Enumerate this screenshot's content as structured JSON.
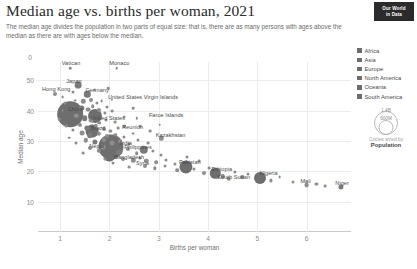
{
  "header": {
    "title": "Median age vs. births per woman, 2021",
    "subtitle": "The median age divides the population in two parts of equal size: that is, there are as many persons with ages above the median as there are with ages below the median."
  },
  "badge": {
    "line1": "Our World",
    "line2": "in Data"
  },
  "legend": {
    "entries": [
      {
        "label": "Africa",
        "color": "#6d6d6d"
      },
      {
        "label": "Asia",
        "color": "#6d6d6d"
      },
      {
        "label": "Europe",
        "color": "#6d6d6d"
      },
      {
        "label": "North America",
        "color": "#6d6d6d"
      },
      {
        "label": "Oceania",
        "color": "#6d6d6d"
      },
      {
        "label": "South America",
        "color": "#6d6d6d"
      }
    ],
    "size_top": "1.4B",
    "size_mid": "600M",
    "size_caption_1": "Circles sized by",
    "size_caption_2": "Population"
  },
  "chart_data": {
    "type": "scatter",
    "title": "Median age vs. births per woman, 2021",
    "xlabel": "Births per woman",
    "ylabel": "Median age",
    "xlim": [
      0.55,
      6.9
    ],
    "ylim": [
      0,
      56
    ],
    "xticks": [
      "0",
      "1",
      "2",
      "3",
      "4",
      "5",
      "6"
    ],
    "xtick_values": [
      0,
      1,
      2,
      3,
      4,
      5,
      6
    ],
    "yticks": [
      "10",
      "20",
      "30",
      "40",
      "50"
    ],
    "ytick_values": [
      10,
      20,
      30,
      40,
      50
    ],
    "grid": true,
    "legend_position": "right",
    "size_encoding": "Population",
    "points": [
      {
        "name": "Vatican",
        "x": 1.2,
        "y": 54.0,
        "r": 1.3,
        "label": true,
        "lx": 1.22,
        "ly": 55.6
      },
      {
        "name": "Monaco",
        "x": 2.15,
        "y": 53.9,
        "r": 1.3,
        "label": true,
        "lx": 2.2,
        "ly": 55.6
      },
      {
        "name": "Japan",
        "x": 1.36,
        "y": 48.4,
        "r": 3.4,
        "label": true,
        "lx": 1.28,
        "ly": 49.9
      },
      {
        "name": "Hong Kong",
        "x": 0.9,
        "y": 45.6,
        "r": 2.0,
        "label": true,
        "lx": 0.92,
        "ly": 47.1
      },
      {
        "name": "Germany",
        "x": 1.55,
        "y": 45.4,
        "r": 3.2,
        "label": true,
        "lx": 1.75,
        "ly": 46.7
      },
      {
        "name": "China",
        "x": 1.2,
        "y": 38.9,
        "r": 12.8,
        "label": true,
        "lx": 1.31,
        "ly": 40.6
      },
      {
        "name": "United States",
        "x": 1.7,
        "y": 38.2,
        "r": 7.0,
        "label": true,
        "lx": 1.97,
        "ly": 37.6
      },
      {
        "name": "United States Virgin Islands",
        "x": 2.05,
        "y": 43.5,
        "r": 1.2,
        "label": true,
        "lx": 2.68,
        "ly": 44.6
      },
      {
        "name": "Faroe Islands",
        "x": 2.55,
        "y": 37.5,
        "r": 1.2,
        "label": true,
        "lx": 3.15,
        "ly": 38.5
      },
      {
        "name": "Brazil",
        "x": 1.65,
        "y": 33.2,
        "r": 6.4,
        "label": true,
        "lx": 1.77,
        "ly": 34.4
      },
      {
        "name": "Reunion",
        "x": 2.3,
        "y": 34.8,
        "r": 1.2,
        "label": true,
        "lx": 2.47,
        "ly": 34.6
      },
      {
        "name": "Kazakhstan",
        "x": 3.05,
        "y": 30.9,
        "r": 2.2,
        "label": true,
        "lx": 3.24,
        "ly": 32.1
      },
      {
        "name": "India",
        "x": 2.03,
        "y": 27.9,
        "r": 12.6,
        "label": true,
        "lx": 2.33,
        "ly": 29.3
      },
      {
        "name": "Nepal",
        "x": 1.87,
        "y": 27.9,
        "r": 2.4,
        "label": true,
        "lx": 1.74,
        "ly": 28.4
      },
      {
        "name": "Philippines",
        "x": 2.7,
        "y": 27.0,
        "r": 4.2,
        "label": true,
        "lx": 2.58,
        "ly": 28.1
      },
      {
        "name": "Bangladesh",
        "x": 2.0,
        "y": 25.1,
        "r": 5.6,
        "label": true,
        "lx": 2.4,
        "ly": 24.6
      },
      {
        "name": "Syria",
        "x": 2.75,
        "y": 23.5,
        "r": 2.2,
        "label": true,
        "lx": 2.67,
        "ly": 22.8
      },
      {
        "name": "Pakistan",
        "x": 3.55,
        "y": 21.5,
        "r": 6.6,
        "label": true,
        "lx": 3.63,
        "ly": 23.2
      },
      {
        "name": "Ethiopia",
        "x": 4.15,
        "y": 19.3,
        "r": 5.2,
        "label": true,
        "lx": 4.28,
        "ly": 20.6
      },
      {
        "name": "South Sudan",
        "x": 4.42,
        "y": 17.6,
        "r": 2.2,
        "label": true,
        "lx": 4.52,
        "ly": 18.1
      },
      {
        "name": "Nigeria",
        "x": 5.05,
        "y": 17.7,
        "r": 6.0,
        "label": true,
        "lx": 5.23,
        "ly": 19.4
      },
      {
        "name": "Mali",
        "x": 6.0,
        "y": 15.5,
        "r": 2.4,
        "label": true,
        "lx": 5.98,
        "ly": 16.7
      },
      {
        "name": "Niger",
        "x": 6.7,
        "y": 14.8,
        "r": 2.6,
        "label": true,
        "lx": 6.72,
        "ly": 16.3
      },
      {
        "name": "c01",
        "x": 1.09,
        "y": 42.6,
        "r": 1.6,
        "label": false
      },
      {
        "name": "c02",
        "x": 1.3,
        "y": 43.3,
        "r": 1.4,
        "label": false
      },
      {
        "name": "c03",
        "x": 1.47,
        "y": 43.0,
        "r": 2.2,
        "label": false
      },
      {
        "name": "c04",
        "x": 1.62,
        "y": 43.6,
        "r": 2.0,
        "label": false
      },
      {
        "name": "c05",
        "x": 1.74,
        "y": 42.4,
        "r": 1.6,
        "label": false
      },
      {
        "name": "c06",
        "x": 1.84,
        "y": 43.1,
        "r": 1.4,
        "label": false
      },
      {
        "name": "c07",
        "x": 1.95,
        "y": 41.2,
        "r": 1.5,
        "label": false
      },
      {
        "name": "c08",
        "x": 1.43,
        "y": 41.0,
        "r": 2.6,
        "label": false
      },
      {
        "name": "c09",
        "x": 1.57,
        "y": 40.3,
        "r": 2.4,
        "label": false
      },
      {
        "name": "c10",
        "x": 1.66,
        "y": 41.5,
        "r": 1.8,
        "label": false
      },
      {
        "name": "c11",
        "x": 1.78,
        "y": 40.1,
        "r": 2.0,
        "label": false
      },
      {
        "name": "c12",
        "x": 1.9,
        "y": 39.3,
        "r": 1.6,
        "label": false
      },
      {
        "name": "c13",
        "x": 2.05,
        "y": 39.8,
        "r": 1.4,
        "label": false
      },
      {
        "name": "c14",
        "x": 1.33,
        "y": 38.3,
        "r": 2.2,
        "label": false
      },
      {
        "name": "c15",
        "x": 1.5,
        "y": 37.4,
        "r": 2.8,
        "label": false
      },
      {
        "name": "c16",
        "x": 1.63,
        "y": 36.7,
        "r": 2.4,
        "label": false
      },
      {
        "name": "c17",
        "x": 1.79,
        "y": 36.0,
        "r": 1.8,
        "label": false
      },
      {
        "name": "c18",
        "x": 1.92,
        "y": 36.8,
        "r": 1.5,
        "label": false
      },
      {
        "name": "c19",
        "x": 2.12,
        "y": 36.2,
        "r": 1.4,
        "label": false
      },
      {
        "name": "c20",
        "x": 2.3,
        "y": 38.0,
        "r": 1.3,
        "label": false
      },
      {
        "name": "c21",
        "x": 1.4,
        "y": 35.1,
        "r": 2.0,
        "label": false
      },
      {
        "name": "c22",
        "x": 1.55,
        "y": 34.3,
        "r": 2.6,
        "label": false
      },
      {
        "name": "c23",
        "x": 1.72,
        "y": 35.0,
        "r": 2.2,
        "label": false
      },
      {
        "name": "c24",
        "x": 1.88,
        "y": 34.0,
        "r": 2.0,
        "label": false
      },
      {
        "name": "c25",
        "x": 2.02,
        "y": 33.4,
        "r": 1.6,
        "label": false
      },
      {
        "name": "c26",
        "x": 2.18,
        "y": 34.2,
        "r": 1.4,
        "label": false
      },
      {
        "name": "c27",
        "x": 1.25,
        "y": 33.6,
        "r": 1.6,
        "label": false
      },
      {
        "name": "c28",
        "x": 1.44,
        "y": 32.6,
        "r": 2.4,
        "label": false
      },
      {
        "name": "c29",
        "x": 1.6,
        "y": 31.8,
        "r": 2.8,
        "label": false
      },
      {
        "name": "c30",
        "x": 1.78,
        "y": 32.4,
        "r": 2.2,
        "label": false
      },
      {
        "name": "c31",
        "x": 1.95,
        "y": 31.5,
        "r": 2.0,
        "label": false
      },
      {
        "name": "c32",
        "x": 2.12,
        "y": 32.0,
        "r": 1.7,
        "label": false
      },
      {
        "name": "c33",
        "x": 2.3,
        "y": 31.2,
        "r": 1.5,
        "label": false
      },
      {
        "name": "c34",
        "x": 2.48,
        "y": 32.4,
        "r": 1.4,
        "label": false
      },
      {
        "name": "c35",
        "x": 1.52,
        "y": 30.2,
        "r": 2.2,
        "label": false
      },
      {
        "name": "c36",
        "x": 1.7,
        "y": 29.6,
        "r": 2.6,
        "label": false
      },
      {
        "name": "c37",
        "x": 1.88,
        "y": 30.4,
        "r": 2.0,
        "label": false
      },
      {
        "name": "c38",
        "x": 2.05,
        "y": 29.2,
        "r": 2.4,
        "label": false
      },
      {
        "name": "c39",
        "x": 2.22,
        "y": 30.0,
        "r": 1.8,
        "label": false
      },
      {
        "name": "c40",
        "x": 2.4,
        "y": 29.0,
        "r": 1.6,
        "label": false
      },
      {
        "name": "c41",
        "x": 2.58,
        "y": 30.2,
        "r": 1.5,
        "label": false
      },
      {
        "name": "c42",
        "x": 2.78,
        "y": 29.4,
        "r": 1.4,
        "label": false
      },
      {
        "name": "c43",
        "x": 1.6,
        "y": 27.6,
        "r": 2.0,
        "label": false
      },
      {
        "name": "c44",
        "x": 1.78,
        "y": 26.8,
        "r": 2.2,
        "label": false
      },
      {
        "name": "c45",
        "x": 2.2,
        "y": 26.4,
        "r": 2.6,
        "label": false
      },
      {
        "name": "c46",
        "x": 2.38,
        "y": 27.2,
        "r": 2.0,
        "label": false
      },
      {
        "name": "c47",
        "x": 2.55,
        "y": 26.0,
        "r": 1.8,
        "label": false
      },
      {
        "name": "c48",
        "x": 2.88,
        "y": 26.6,
        "r": 1.6,
        "label": false
      },
      {
        "name": "c49",
        "x": 3.05,
        "y": 25.4,
        "r": 1.5,
        "label": false
      },
      {
        "name": "c50",
        "x": 2.28,
        "y": 24.2,
        "r": 2.0,
        "label": false
      },
      {
        "name": "c51",
        "x": 2.48,
        "y": 23.6,
        "r": 2.2,
        "label": false
      },
      {
        "name": "c52",
        "x": 2.62,
        "y": 24.4,
        "r": 1.6,
        "label": false
      },
      {
        "name": "c53",
        "x": 2.95,
        "y": 23.0,
        "r": 1.8,
        "label": false
      },
      {
        "name": "c54",
        "x": 3.15,
        "y": 23.8,
        "r": 1.5,
        "label": false
      },
      {
        "name": "c55",
        "x": 3.32,
        "y": 22.4,
        "r": 1.6,
        "label": false
      },
      {
        "name": "c56",
        "x": 2.72,
        "y": 21.8,
        "r": 2.0,
        "label": false
      },
      {
        "name": "c57",
        "x": 2.92,
        "y": 21.0,
        "r": 1.7,
        "label": false
      },
      {
        "name": "c58",
        "x": 3.12,
        "y": 21.6,
        "r": 1.5,
        "label": false
      },
      {
        "name": "c59",
        "x": 3.38,
        "y": 20.4,
        "r": 1.8,
        "label": false
      },
      {
        "name": "c60",
        "x": 3.72,
        "y": 20.8,
        "r": 1.6,
        "label": false
      },
      {
        "name": "c61",
        "x": 3.92,
        "y": 19.6,
        "r": 2.0,
        "label": false
      },
      {
        "name": "c62",
        "x": 4.02,
        "y": 21.0,
        "r": 1.4,
        "label": false
      },
      {
        "name": "c63",
        "x": 4.3,
        "y": 18.4,
        "r": 2.2,
        "label": false
      },
      {
        "name": "c64",
        "x": 4.55,
        "y": 19.8,
        "r": 1.6,
        "label": false
      },
      {
        "name": "c65",
        "x": 4.68,
        "y": 18.2,
        "r": 2.0,
        "label": false
      },
      {
        "name": "c66",
        "x": 4.82,
        "y": 19.2,
        "r": 1.5,
        "label": false
      },
      {
        "name": "c67",
        "x": 5.28,
        "y": 17.0,
        "r": 1.6,
        "label": false
      },
      {
        "name": "c68",
        "x": 5.45,
        "y": 18.0,
        "r": 1.4,
        "label": false
      },
      {
        "name": "c69",
        "x": 5.72,
        "y": 16.4,
        "r": 1.5,
        "label": false
      },
      {
        "name": "c70",
        "x": 6.2,
        "y": 15.8,
        "r": 1.6,
        "label": false
      },
      {
        "name": "c71",
        "x": 6.38,
        "y": 15.0,
        "r": 1.4,
        "label": false
      },
      {
        "name": "c72",
        "x": 1.05,
        "y": 40.0,
        "r": 1.4,
        "label": false
      },
      {
        "name": "c73",
        "x": 0.98,
        "y": 37.2,
        "r": 1.3,
        "label": false
      },
      {
        "name": "c74",
        "x": 1.12,
        "y": 35.0,
        "r": 1.4,
        "label": false
      },
      {
        "name": "c75",
        "x": 1.18,
        "y": 31.0,
        "r": 1.3,
        "label": false
      },
      {
        "name": "c76",
        "x": 1.33,
        "y": 29.4,
        "r": 1.5,
        "label": false
      },
      {
        "name": "c77",
        "x": 1.46,
        "y": 26.0,
        "r": 1.4,
        "label": false
      },
      {
        "name": "c78",
        "x": 1.9,
        "y": 24.0,
        "r": 1.6,
        "label": false
      },
      {
        "name": "c79",
        "x": 2.08,
        "y": 22.6,
        "r": 1.5,
        "label": false
      },
      {
        "name": "c80",
        "x": 2.4,
        "y": 21.4,
        "r": 1.4,
        "label": false
      },
      {
        "name": "c81",
        "x": 3.58,
        "y": 24.8,
        "r": 1.5,
        "label": false
      },
      {
        "name": "c82",
        "x": 3.82,
        "y": 23.4,
        "r": 1.4,
        "label": false
      },
      {
        "name": "c83",
        "x": 2.62,
        "y": 34.8,
        "r": 1.3,
        "label": false
      },
      {
        "name": "c84",
        "x": 2.82,
        "y": 33.2,
        "r": 1.4,
        "label": false
      },
      {
        "name": "c85",
        "x": 3.02,
        "y": 35.4,
        "r": 1.3,
        "label": false
      },
      {
        "name": "c86",
        "x": 2.48,
        "y": 40.8,
        "r": 1.3,
        "label": false
      },
      {
        "name": "c87",
        "x": 1.7,
        "y": 46.8,
        "r": 1.4,
        "label": false
      },
      {
        "name": "c88",
        "x": 1.98,
        "y": 47.4,
        "r": 1.3,
        "label": false
      },
      {
        "name": "c89",
        "x": 1.25,
        "y": 46.2,
        "r": 1.5,
        "label": false
      },
      {
        "name": "c90",
        "x": 1.05,
        "y": 44.4,
        "r": 1.4,
        "label": false
      }
    ]
  }
}
